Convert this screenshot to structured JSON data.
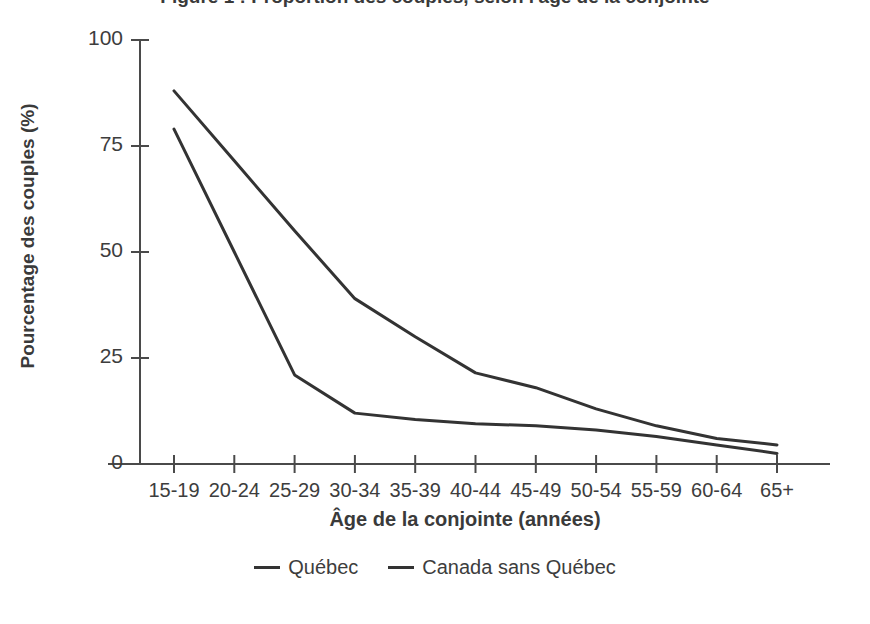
{
  "chart_data": {
    "type": "line",
    "title": "Figure 1 : Proportion des couples, selon l'âge de la conjointe",
    "xlabel": "Âge de la conjointe (années)",
    "ylabel": "Pourcentage des couples (%)",
    "categories": [
      "15-19",
      "20-24",
      "25-29",
      "30-34",
      "35-39",
      "40-44",
      "45-49",
      "50-54",
      "55-59",
      "60-64",
      "65+"
    ],
    "series": [
      {
        "name": "Québec",
        "color": "#333333",
        "values": [
          88,
          71.5,
          55,
          39,
          30,
          21.5,
          18,
          13,
          9,
          6,
          4.5
        ]
      },
      {
        "name": "Canada sans Québec",
        "color": "#333333",
        "values": [
          79,
          50,
          21,
          12,
          10.5,
          9.5,
          9,
          8,
          6.5,
          4.5,
          2.5
        ]
      }
    ],
    "ylim": [
      0,
      100
    ],
    "yticks": [
      0,
      25,
      50,
      75,
      100
    ],
    "ytick_labels": [
      "0",
      "25",
      "50",
      "75",
      "100"
    ],
    "grid": false,
    "legend_position": "bottom"
  }
}
